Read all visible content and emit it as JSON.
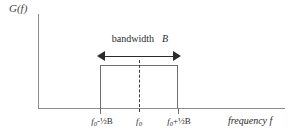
{
  "figure": {
    "background_color": "#ffffff",
    "axis_color": "#8c8c8c",
    "line_color": "#2b2b2b"
  },
  "axes": {
    "y_axis_label": "G(f)",
    "x_axis_caption": "frequency f"
  },
  "annotations": {
    "bandwidth_text": "bandwidth",
    "bandwidth_symbol": "B"
  },
  "x_ticks": [
    {
      "label_prefix": "f",
      "label_sub": "0",
      "label_suffix": "-½B",
      "full": "f0-½B"
    },
    {
      "label_prefix": "f",
      "label_sub": "0",
      "label_suffix": "",
      "full": "f0"
    },
    {
      "label_prefix": "f",
      "label_sub": "0",
      "label_suffix": "+½B",
      "full": "f0+½B"
    }
  ],
  "chart_data": {
    "type": "area",
    "title": "",
    "xlabel": "frequency f",
    "ylabel": "G(f)",
    "categories": [
      "f0-½B",
      "f0",
      "f0+½B"
    ],
    "values": [
      1,
      1,
      1
    ],
    "grid": false,
    "legend": "none",
    "annotations": [
      {
        "text": "bandwidth B",
        "type": "double-arrow",
        "from": "f0-½B",
        "to": "f0+½B"
      },
      {
        "text": "f0",
        "type": "dashed-vertical-line"
      }
    ]
  }
}
